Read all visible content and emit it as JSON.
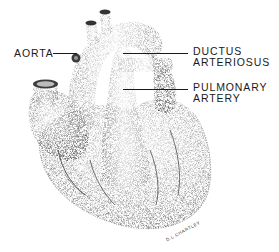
{
  "figure": {
    "labels": {
      "aorta": "AORTA",
      "ductus_line1": "DUCTUS",
      "ductus_line2": "ARTERIOSUS",
      "pulmonary_line1": "PULMONARY",
      "pulmonary_line2": "ARTERY"
    },
    "signature": "D.L.CHARTLEY"
  },
  "colors": {
    "background": "#ffffff",
    "ink": "#1a1a1a"
  }
}
